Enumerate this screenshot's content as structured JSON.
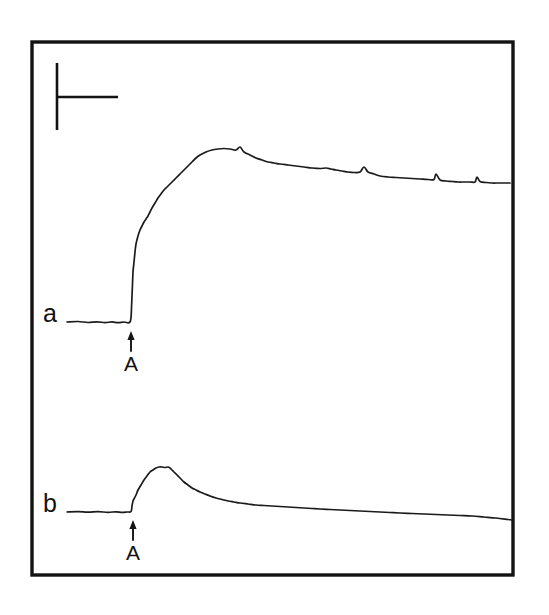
{
  "figure": {
    "type": "scientific-recording-figure",
    "background_color": "#ffffff",
    "ink_color": "#131313",
    "frame": {
      "x": 32,
      "y": 42,
      "width": 481,
      "height": 533,
      "stroke_width": 3.4
    },
    "scale_bar": {
      "name": "calibration-bar",
      "shape": "L-shaped tick (vertical amplitude + horizontal time)",
      "vertical_x": 57,
      "vertical_y_top": 63,
      "vertical_y_bottom": 130,
      "horizontal_y": 97,
      "horizontal_x_start": 57,
      "horizontal_x_end": 118
    },
    "traces": [
      {
        "label": "a",
        "label_x": 43,
        "label_y": 322,
        "description": "Sustained response: rapid upward deflection at stimulus onset rising to a maintained plateau that slowly declines with small superimposed spike artifacts.",
        "baseline_y": 322,
        "peak_y": 148,
        "onset_x": 131,
        "peak_x": 195,
        "end_y": 183,
        "stimulus_marker": {
          "name": "stimulus-arrow-a",
          "symbol": "up-arrow",
          "label": "A",
          "x": 131,
          "arrow_top_y": 333,
          "arrow_bottom_y": 351,
          "label_y": 371
        }
      },
      {
        "label": "b",
        "label_x": 43,
        "label_y": 512,
        "description": "Transient response: smaller rapid rise at stimulus onset to a brief peak followed by a slow exponential decay back toward baseline.",
        "baseline_y": 512,
        "peak_y": 467,
        "onset_x": 133,
        "peak_x": 165,
        "end_y": 520,
        "stimulus_marker": {
          "name": "stimulus-arrow-b",
          "symbol": "up-arrow",
          "label": "A",
          "x": 133,
          "arrow_top_y": 522,
          "arrow_bottom_y": 540,
          "label_y": 560
        }
      }
    ]
  },
  "chart_data": {
    "type": "line",
    "title": "",
    "subtitle": "",
    "xlabel": "",
    "ylabel": "",
    "grid": false,
    "legend": "none",
    "axis_visible": false,
    "frame_box": true,
    "xlim": [
      32,
      513
    ],
    "ylim": [
      575,
      42
    ],
    "annotations": [
      {
        "name": "calibration-scale-bar",
        "text": "",
        "type": "scale-bar",
        "x": 57,
        "y": 97,
        "vertical_extent": [
          63,
          130
        ],
        "horizontal_extent": [
          57,
          118
        ]
      },
      {
        "name": "trace-a-label",
        "text": "a",
        "x": 43,
        "y": 322
      },
      {
        "name": "trace-a-stimulus-label",
        "text": "A",
        "x": 131,
        "y": 371
      },
      {
        "name": "trace-b-label",
        "text": "b",
        "x": 43,
        "y": 512
      },
      {
        "name": "trace-b-stimulus-label",
        "text": "A",
        "x": 133,
        "y": 560
      }
    ],
    "series": [
      {
        "name": "a",
        "comment": "Sustained plateau response. Coordinates are in image pixel space; y decreases upward (larger response = smaller y).",
        "x": [
          67,
          78,
          88,
          97,
          105,
          112,
          118,
          124,
          128,
          130,
          131,
          131.5,
          132,
          132.5,
          133,
          134,
          135,
          136,
          138,
          140,
          142,
          144,
          146,
          148,
          150,
          152,
          155,
          158,
          161,
          164,
          167,
          170,
          173,
          176,
          180,
          184,
          188,
          192,
          196,
          200,
          206,
          212,
          218,
          224,
          230,
          236,
          240,
          244,
          250,
          256,
          262,
          268,
          274,
          280,
          288,
          296,
          304,
          312,
          320,
          326,
          331,
          336,
          342,
          348,
          354,
          360,
          364,
          368,
          374,
          380,
          388,
          396,
          404,
          412,
          420,
          428,
          434,
          436,
          440,
          446,
          452,
          458,
          464,
          470,
          475,
          477,
          480,
          486,
          492,
          498,
          504,
          510
        ],
        "y": [
          322,
          321.5,
          322.5,
          321.8,
          322.6,
          321.9,
          322.7,
          322,
          322.8,
          322,
          318,
          308,
          296,
          284,
          272,
          262,
          252,
          244,
          236,
          230,
          226,
          222,
          219,
          216,
          212,
          208,
          203,
          198,
          194,
          190,
          187,
          184,
          181,
          178,
          174,
          170,
          166,
          162,
          158,
          155,
          152,
          150,
          149,
          148.5,
          149,
          150,
          147,
          152,
          155,
          158,
          160,
          162,
          163,
          164,
          165,
          166,
          167,
          168,
          168.5,
          168,
          169,
          170,
          171,
          172,
          172.5,
          172,
          167,
          172,
          174,
          176,
          177,
          177.5,
          178,
          178.5,
          179,
          179.5,
          179.5,
          174,
          180,
          181,
          181.5,
          182,
          182,
          182,
          182,
          177,
          181.5,
          182.5,
          183,
          183,
          183,
          183
        ]
      },
      {
        "name": "b",
        "comment": "Transient peaked response with slow decay. Coordinates are in image pixel space; y decreases upward.",
        "x": [
          67,
          78,
          88,
          98,
          108,
          116,
          122,
          127,
          131,
          132,
          133,
          134,
          136,
          138,
          141,
          144,
          147,
          150,
          153,
          156,
          159,
          162,
          165,
          168,
          170,
          172,
          174,
          177,
          180,
          184,
          188,
          192,
          196,
          200,
          205,
          210,
          216,
          222,
          228,
          234,
          240,
          248,
          256,
          264,
          272,
          280,
          288,
          296,
          304,
          312,
          320,
          330,
          340,
          350,
          360,
          370,
          380,
          390,
          400,
          412,
          424,
          436,
          448,
          460,
          472,
          484,
          496,
          508,
          512
        ],
        "y": [
          512,
          511.6,
          512.2,
          511.7,
          512.3,
          511.8,
          512.4,
          512,
          511.5,
          506,
          501,
          499,
          495,
          490,
          485,
          480,
          476,
          472,
          470,
          468,
          467,
          467,
          467.5,
          467,
          468,
          470,
          472,
          475,
          478,
          482,
          485,
          488,
          490,
          492,
          494,
          496,
          498,
          499.5,
          501,
          502,
          503,
          504,
          505,
          505.5,
          506,
          506.5,
          507,
          507.5,
          508,
          508.5,
          509,
          509.5,
          510,
          510.5,
          511,
          511.5,
          512,
          512.5,
          513,
          513.5,
          514,
          514.5,
          515,
          515.5,
          516,
          517,
          518,
          519.5,
          520
        ]
      }
    ]
  }
}
